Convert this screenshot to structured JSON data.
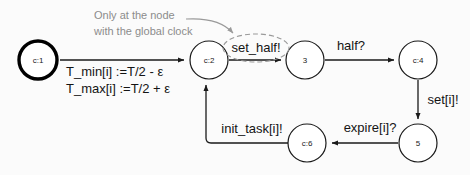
{
  "diagram": {
    "colors": {
      "node_stroke": "#1a1a1a",
      "initial_node_stroke": "#000000",
      "edge": "#1a1a1a",
      "annotation": "#8c8c8c",
      "highlight": "#9a9a9a",
      "background": "#fbfbfb"
    },
    "nodes": [
      {
        "id": "n1",
        "label": "c:1",
        "cx": 38,
        "cy": 60,
        "r": 20,
        "initial": true
      },
      {
        "id": "n2",
        "label": "c:2",
        "cx": 209,
        "cy": 60,
        "r": 19,
        "initial": false
      },
      {
        "id": "n3",
        "label": "3",
        "cx": 305,
        "cy": 60,
        "r": 19,
        "initial": false
      },
      {
        "id": "n4",
        "label": "c:4",
        "cx": 418,
        "cy": 60,
        "r": 19,
        "initial": false
      },
      {
        "id": "n5",
        "label": "5",
        "cx": 418,
        "cy": 143,
        "r": 19,
        "initial": false
      },
      {
        "id": "n6",
        "label": "c:6",
        "cx": 307,
        "cy": 143,
        "r": 19,
        "initial": false
      }
    ],
    "edges": [
      {
        "id": "e1",
        "from": "c:1",
        "to": "c:2",
        "label": ""
      },
      {
        "id": "e2",
        "from": "c:2",
        "to": "3",
        "label": "set_half!"
      },
      {
        "id": "e3",
        "from": "3",
        "to": "c:4",
        "label": "half?"
      },
      {
        "id": "e4",
        "from": "c:4",
        "to": "5",
        "label": "set[i]!"
      },
      {
        "id": "e5",
        "from": "5",
        "to": "c:6",
        "label": "expire[i]?"
      },
      {
        "id": "e6",
        "from": "c:6",
        "to": "c:2",
        "label": "init_task[i]!"
      }
    ],
    "assignments": {
      "line1": "T_min[i] :=T/2 - ε",
      "line2": "T_max[i] :=T/2 + ε"
    },
    "annotation": {
      "line1": "Only at the node",
      "line2": "with the global clock",
      "points_to": "set_half!"
    },
    "highlight": {
      "target_label": "set_half!",
      "style": "dashed-ellipse"
    }
  }
}
